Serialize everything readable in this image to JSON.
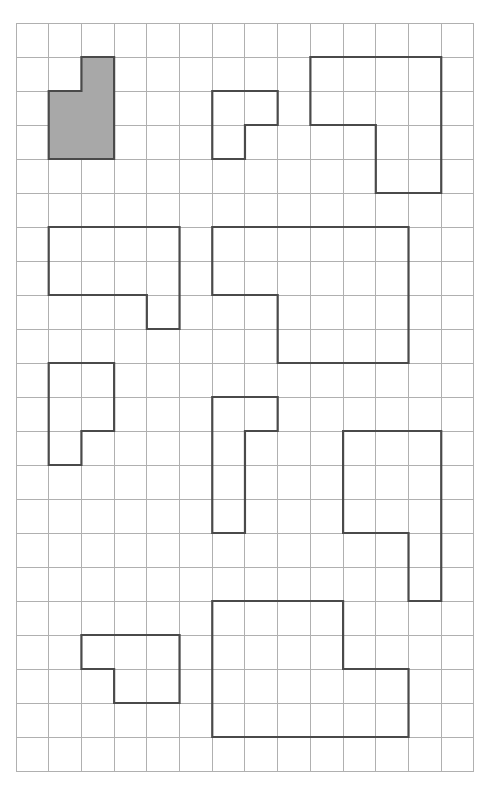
{
  "diagram": {
    "type": "grid-polyomino-figures",
    "grid": {
      "columns": 14,
      "rows": 22,
      "origin_x": 16,
      "origin_y": 23,
      "cell_width": 32.71,
      "cell_height": 34.0
    },
    "colors": {
      "background": "#ffffff",
      "grid_line": "#b0b0b0",
      "shape_stroke": "#4a4a4a",
      "shaded_fill": "#a8a8a8",
      "unshaded_fill": "none"
    },
    "shapes": [
      {
        "id": "shape-1-shaded",
        "shaded": true,
        "points": [
          [
            2,
            1
          ],
          [
            3,
            1
          ],
          [
            3,
            4
          ],
          [
            1,
            4
          ],
          [
            1,
            2
          ],
          [
            2,
            2
          ]
        ]
      },
      {
        "id": "shape-2",
        "shaded": false,
        "points": [
          [
            6,
            2
          ],
          [
            8,
            2
          ],
          [
            8,
            3
          ],
          [
            7,
            3
          ],
          [
            7,
            4
          ],
          [
            6,
            4
          ]
        ]
      },
      {
        "id": "shape-3",
        "shaded": false,
        "points": [
          [
            9,
            1
          ],
          [
            13,
            1
          ],
          [
            13,
            5
          ],
          [
            11,
            5
          ],
          [
            11,
            3
          ],
          [
            9,
            3
          ]
        ]
      },
      {
        "id": "shape-4",
        "shaded": false,
        "points": [
          [
            1,
            6
          ],
          [
            5,
            6
          ],
          [
            5,
            9
          ],
          [
            4,
            9
          ],
          [
            4,
            8
          ],
          [
            1,
            8
          ]
        ]
      },
      {
        "id": "shape-5",
        "shaded": false,
        "points": [
          [
            6,
            6
          ],
          [
            12,
            6
          ],
          [
            12,
            10
          ],
          [
            8,
            10
          ],
          [
            8,
            8
          ],
          [
            6,
            8
          ]
        ]
      },
      {
        "id": "shape-6",
        "shaded": false,
        "points": [
          [
            1,
            10
          ],
          [
            3,
            10
          ],
          [
            3,
            12
          ],
          [
            2,
            12
          ],
          [
            2,
            13
          ],
          [
            1,
            13
          ]
        ]
      },
      {
        "id": "shape-7",
        "shaded": false,
        "points": [
          [
            6,
            11
          ],
          [
            8,
            11
          ],
          [
            8,
            12
          ],
          [
            7,
            12
          ],
          [
            7,
            15
          ],
          [
            6,
            15
          ]
        ]
      },
      {
        "id": "shape-8",
        "shaded": false,
        "points": [
          [
            10,
            12
          ],
          [
            13,
            12
          ],
          [
            13,
            17
          ],
          [
            12,
            17
          ],
          [
            12,
            15
          ],
          [
            10,
            15
          ]
        ]
      },
      {
        "id": "shape-9",
        "shaded": false,
        "points": [
          [
            2,
            18
          ],
          [
            5,
            18
          ],
          [
            5,
            20
          ],
          [
            3,
            20
          ],
          [
            3,
            19
          ],
          [
            2,
            19
          ]
        ]
      },
      {
        "id": "shape-10",
        "shaded": false,
        "points": [
          [
            6,
            17
          ],
          [
            10,
            17
          ],
          [
            10,
            19
          ],
          [
            12,
            19
          ],
          [
            12,
            21
          ],
          [
            6,
            21
          ]
        ]
      }
    ]
  }
}
